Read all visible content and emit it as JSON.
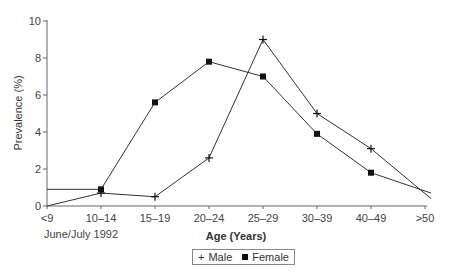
{
  "chart_data": {
    "type": "line",
    "title": "",
    "xlabel": "Age (Years)",
    "ylabel": "Prevalence (%)",
    "ylim": [
      0,
      10
    ],
    "yticks": [
      0,
      2,
      4,
      6,
      8,
      10
    ],
    "grid": false,
    "categories": [
      "<9",
      "10–14",
      "15–19",
      "20–24",
      "25–29",
      "30–39",
      "40–49",
      ">50"
    ],
    "series": [
      {
        "name": "Male",
        "marker": "plus",
        "values": [
          0.0,
          0.7,
          0.5,
          2.6,
          9.0,
          5.0,
          3.1,
          0.4
        ]
      },
      {
        "name": "Female",
        "marker": "square",
        "values": [
          0.9,
          0.9,
          5.6,
          7.8,
          7.0,
          3.9,
          1.8,
          0.7
        ]
      }
    ],
    "annotations": [
      "June/July 1992"
    ],
    "legend_position": "bottom-center"
  },
  "labels": {
    "note": "June/July 1992",
    "legend_male": "Male",
    "legend_female": "Female",
    "legend_male_symbol": "+"
  }
}
